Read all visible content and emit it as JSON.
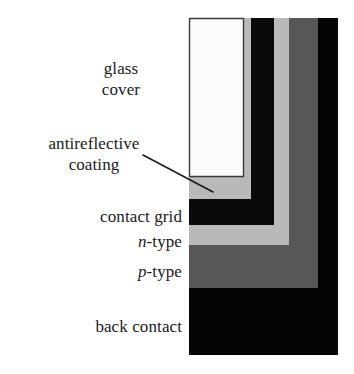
{
  "figure": {
    "background_color": "#ffffff",
    "width": 354,
    "height": 374
  },
  "labels": {
    "glass_cover_line1": "glass",
    "glass_cover_line2": "cover",
    "antireflective_line1": "antireflective",
    "antireflective_line2": "coating",
    "contact_grid": "contact grid",
    "n_type_italic": "n",
    "n_type_rest": "-type",
    "p_type_italic": "p",
    "p_type_rest": "-type",
    "back_contact": "back contact"
  },
  "layers": [
    {
      "name": "glass cover",
      "color": "#fbfbfa",
      "stroke": "#3a3a3a"
    },
    {
      "name": "antireflective coating",
      "color": "#b9b9b9",
      "stroke": "none"
    },
    {
      "name": "contact grid",
      "color": "#0a0a0a",
      "stroke": "none"
    },
    {
      "name": "n-type",
      "color": "#b9b9b9",
      "stroke": "none"
    },
    {
      "name": "p-type",
      "color": "#575757",
      "stroke": "none"
    },
    {
      "name": "back contact",
      "color": "#050505",
      "stroke": "none"
    }
  ],
  "leader_line": {
    "from_label": "antireflective coating",
    "color": "#1a1a1a",
    "x1": 143,
    "y1": 155,
    "x2": 213,
    "y2": 192
  }
}
